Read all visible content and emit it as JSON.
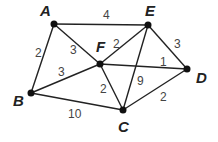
{
  "diagram": {
    "type": "weighted-undirected-graph",
    "nodes": [
      {
        "id": "A",
        "label": "A",
        "x": 54,
        "y": 24,
        "lx": 40,
        "ly": 16
      },
      {
        "id": "E",
        "label": "E",
        "x": 148,
        "y": 25,
        "lx": 145,
        "ly": 16
      },
      {
        "id": "F",
        "label": "F",
        "x": 100,
        "y": 64,
        "lx": 96,
        "ly": 52
      },
      {
        "id": "D",
        "label": "D",
        "x": 187,
        "y": 69,
        "lx": 196,
        "ly": 83
      },
      {
        "id": "B",
        "label": "B",
        "x": 31,
        "y": 93,
        "lx": 13,
        "ly": 106
      },
      {
        "id": "C",
        "label": "C",
        "x": 123,
        "y": 110,
        "lx": 118,
        "ly": 132
      }
    ],
    "edges": [
      {
        "from": "A",
        "to": "E",
        "weight": "4",
        "lx": 103,
        "ly": 19
      },
      {
        "from": "A",
        "to": "B",
        "weight": "2",
        "lx": 35,
        "ly": 57
      },
      {
        "from": "A",
        "to": "F",
        "weight": "3",
        "lx": 70,
        "ly": 54
      },
      {
        "from": "E",
        "to": "F",
        "weight": "2",
        "lx": 113,
        "ly": 48
      },
      {
        "from": "E",
        "to": "D",
        "weight": "3",
        "lx": 174,
        "ly": 48
      },
      {
        "from": "E",
        "to": "C",
        "weight": "9",
        "lx": 137,
        "ly": 85
      },
      {
        "from": "F",
        "to": "D",
        "weight": "1",
        "lx": 160,
        "ly": 66
      },
      {
        "from": "F",
        "to": "B",
        "weight": "3",
        "lx": 58,
        "ly": 76
      },
      {
        "from": "F",
        "to": "C",
        "weight": "2",
        "lx": 100,
        "ly": 93
      },
      {
        "from": "B",
        "to": "C",
        "weight": "10",
        "lx": 68,
        "ly": 118
      },
      {
        "from": "C",
        "to": "D",
        "weight": "2",
        "lx": 160,
        "ly": 101
      }
    ]
  }
}
